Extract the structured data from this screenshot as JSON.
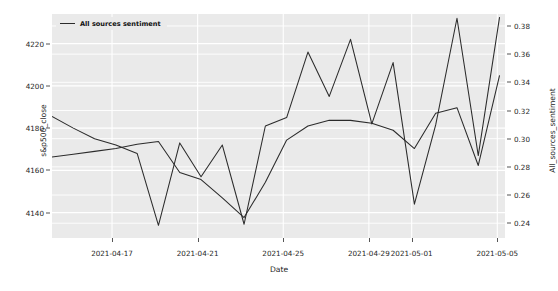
{
  "chart_data": {
    "type": "line",
    "title": "",
    "xlabel": "Date",
    "grid": true,
    "legend_position": "upper-left",
    "legend": [
      "All sources sentiment"
    ],
    "x_tick_labels": [
      "2021-04-17",
      "2021-04-21",
      "2021-04-25",
      "2021-04-29",
      "2021-05-01",
      "2021-05-05"
    ],
    "x_tick_positions": [
      0.1325,
      0.3215,
      0.5105,
      0.6995,
      0.794,
      0.983
    ],
    "axes": [
      {
        "side": "left",
        "label": "s&p500_close",
        "ylim": [
          4128,
          4234
        ],
        "ticks": [
          4140,
          4160,
          4180,
          4200,
          4220
        ],
        "tick_labels": [
          "4140",
          "4160",
          "4180",
          "4200",
          "4220"
        ]
      },
      {
        "side": "right",
        "label": "All_sources_sentiment",
        "ylim": [
          0.2295,
          0.3885
        ],
        "ticks": [
          0.24,
          0.26,
          0.28,
          0.3,
          0.32,
          0.34,
          0.36,
          0.38
        ],
        "tick_labels": [
          "0.24",
          "0.26",
          "0.28",
          "0.30",
          "0.32",
          "0.34",
          "0.36",
          "0.38"
        ]
      }
    ],
    "series": [
      {
        "name": "s&p500_close",
        "axis": "left",
        "color": "#2b2b2b",
        "x": [
          0.0,
          0.047,
          0.094,
          0.141,
          0.188,
          0.235,
          0.282,
          0.329,
          0.376,
          0.424,
          0.471,
          0.518,
          0.565,
          0.612,
          0.659,
          0.706,
          0.753,
          0.8,
          0.847,
          0.894,
          0.941,
          0.988
        ],
        "values": [
          4185.5,
          4180.0,
          4175.0,
          4172.0,
          4168.0,
          4134.0,
          4173.0,
          4157.0,
          4172.0,
          4134.5,
          4181.0,
          4185.0,
          4216.0,
          4195.0,
          4222.0,
          4182.0,
          4211.0,
          4144.0,
          4181.5,
          4232.0,
          4167.0,
          4232.5
        ]
      },
      {
        "name": "All sources sentiment",
        "axis": "right",
        "color": "#2b2b2b",
        "x": [
          0.0,
          0.047,
          0.094,
          0.141,
          0.188,
          0.235,
          0.282,
          0.329,
          0.376,
          0.424,
          0.471,
          0.518,
          0.565,
          0.612,
          0.659,
          0.706,
          0.753,
          0.8,
          0.847,
          0.894,
          0.941,
          0.988
        ],
        "values": [
          0.287,
          0.289,
          0.291,
          0.293,
          0.296,
          0.298,
          0.276,
          0.271,
          0.258,
          0.244,
          0.269,
          0.299,
          0.309,
          0.313,
          0.313,
          0.311,
          0.306,
          0.293,
          0.318,
          0.322,
          0.281,
          0.345
        ]
      }
    ]
  },
  "colors": {
    "plot_background": "#eaeaea",
    "grid": "#ffffff",
    "line": "#2b2b2b",
    "text": "#262626"
  }
}
